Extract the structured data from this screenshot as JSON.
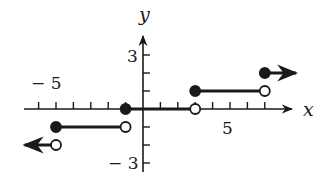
{
  "chart_data": {
    "type": "line",
    "title": "",
    "xlabel": "x",
    "ylabel": "y",
    "xlim": [
      -7,
      8
    ],
    "ylim": [
      -3.5,
      4
    ],
    "grid": false,
    "x_tick_labels": [
      {
        "value": -5,
        "label": "− 5"
      },
      {
        "value": 5,
        "label": "5"
      }
    ],
    "y_tick_labels": [
      {
        "value": 3,
        "label": "3"
      },
      {
        "value": -3,
        "label": "− 3"
      }
    ],
    "x_ticks": [
      -6,
      -5,
      -4,
      -3,
      -2,
      -1,
      1,
      2,
      3,
      4,
      5,
      6,
      7
    ],
    "y_ticks": [
      -3,
      -2,
      -1,
      1,
      2,
      3
    ],
    "segments": [
      {
        "x_start": -5,
        "x_end": -1,
        "y": -1,
        "start": "closed",
        "end": "open"
      },
      {
        "x_start": -1,
        "x_end": 3,
        "y": 0,
        "start": "closed",
        "end": "open"
      },
      {
        "x_start": 3,
        "x_end": 7,
        "y": 1,
        "start": "closed",
        "end": "open"
      }
    ],
    "rays": [
      {
        "x": -5,
        "y": -2,
        "direction": "left",
        "endpoint": "open"
      },
      {
        "x": 7,
        "y": 2,
        "direction": "right",
        "endpoint": "closed"
      }
    ]
  },
  "labels": {
    "x_axis": "x",
    "y_axis": "y",
    "x_neg5": "− 5",
    "x_pos5": "5",
    "y_pos3": "3",
    "y_neg3": "− 3"
  }
}
